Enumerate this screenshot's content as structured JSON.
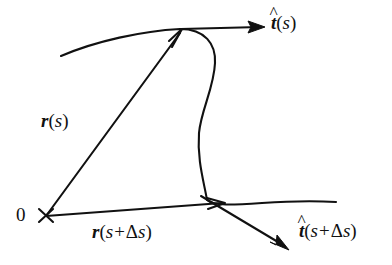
{
  "figure": {
    "background_color": "#ffffff",
    "stroke_color": "#111111",
    "origin_label": "0",
    "origin_marker": "x-cross-mark",
    "labels": {
      "tangent_at_s": {
        "hat": "^",
        "vector": "t",
        "open_paren": "(",
        "arg": "s",
        "close_paren": ")",
        "full_text": "t̂(s)"
      },
      "tangent_at_s_plus_ds": {
        "hat": "^",
        "vector": "t",
        "open_paren": "(",
        "arg": "s",
        "plus": "+",
        "delta": "Δ",
        "arg2": "s",
        "close_paren": ")",
        "full_text": "t̂(s+Δs)"
      },
      "position_at_s": {
        "vector": "r",
        "open_paren": "(",
        "arg": "s",
        "close_paren": ")",
        "full_text": "r(s)"
      },
      "position_at_s_plus_ds": {
        "vector": "r",
        "open_paren": "(",
        "arg": "s",
        "plus": "+",
        "delta": "Δ",
        "arg2": "s",
        "close_paren": ")",
        "full_text": "r(s+Δs)"
      }
    },
    "geometry": {
      "origin_point": [
        46,
        216
      ],
      "point_at_s": [
        180,
        31
      ],
      "point_at_s_plus_ds": [
        206,
        201
      ],
      "curve_path": "M 61 56 C 96 41 142 31 180 29 C 205 29 216 44 215 63 C 214 88 201 110 199 133 C 197 160 204 182 207 200 C 214 206 232 205 262 203 C 292 201 318 201 336 202",
      "vector_r_s": {
        "from": [
          46,
          216
        ],
        "to": [
          181,
          32
        ]
      },
      "vector_r_s_plus_ds": {
        "from": [
          46,
          216
        ],
        "to": [
          224,
          203
        ]
      },
      "vector_t_s": {
        "from": [
          181,
          29
        ],
        "to": [
          264,
          27
        ]
      },
      "vector_t_s_plus_ds": {
        "from": [
          208,
          202
        ],
        "to": [
          288,
          250
        ]
      }
    }
  }
}
